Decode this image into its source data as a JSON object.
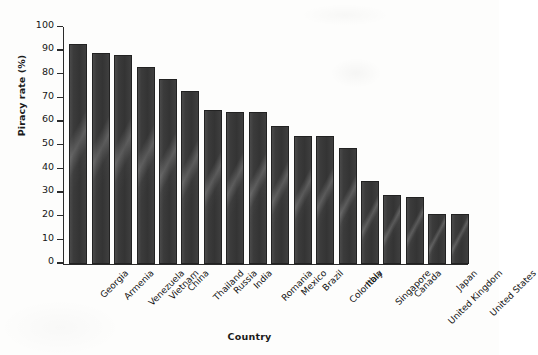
{
  "chart_data": {
    "type": "bar",
    "title": "",
    "xlabel": "Country",
    "ylabel": "Piracy rate (%)",
    "categories": [
      "Georgia",
      "Armenia",
      "Venezuela",
      "Vietnam",
      "China",
      "Thailand",
      "Russia",
      "India",
      "Romania",
      "Mexico",
      "Brazil",
      "Colombia",
      "Italy",
      "Singapore",
      "Canada",
      "United Kingdom",
      "Japan",
      "United States"
    ],
    "values": [
      93,
      89,
      88,
      83,
      78,
      73,
      65,
      64,
      64,
      58,
      54,
      54,
      49,
      35,
      29,
      28,
      21,
      21
    ],
    "ylim": [
      0,
      100
    ],
    "yticks": [
      0,
      10,
      20,
      30,
      40,
      50,
      60,
      70,
      80,
      90,
      100
    ],
    "ytick_labels": [
      "0",
      "10",
      "20",
      "30",
      "40",
      "50",
      "60",
      "70",
      "80",
      "90",
      "100"
    ],
    "grid": false,
    "legend": null,
    "bar_color": "#3a3a3a",
    "background_color": "#fdfdfc"
  }
}
